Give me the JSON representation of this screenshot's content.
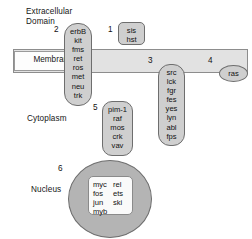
{
  "figure": {
    "type": "diagram",
    "regions": {
      "extracellular": "Extracellular\nDomain",
      "membrane": "Membrane",
      "cytoplasm": "Cytoplasm",
      "nucleus": "Nucleus"
    },
    "colors": {
      "background": "#ffffff",
      "membrane_fill": "#e2e2e2",
      "membrane_stroke": "#8d8d8d",
      "group_fill": "#cfcfcf",
      "group_stroke": "#6e6e6e",
      "nucleus_fill": "#b4b4b4",
      "nucleus_inner_fill": "#fafafa",
      "text": "#111111"
    }
  },
  "groups": [
    {
      "callout": "1",
      "name": "growth-factors",
      "location": "extracellular",
      "genes": [
        "sis",
        "hst"
      ]
    },
    {
      "callout": "2",
      "name": "receptor-tyrosine-kinases",
      "location": "membrane-spanning",
      "genes": [
        "erbB",
        "kit",
        "fms",
        "ret",
        "ros",
        "met",
        "neu",
        "trk"
      ]
    },
    {
      "callout": "3",
      "name": "membrane-associated-tyrosine-kinases",
      "location": "membrane-inner-face",
      "genes": [
        "src",
        "lck",
        "fgr",
        "fes",
        "yes",
        "lyn",
        "abl",
        "fps"
      ]
    },
    {
      "callout": "4",
      "name": "g-protein",
      "location": "membrane-inner-face",
      "genes": [
        "ras"
      ]
    },
    {
      "callout": "5",
      "name": "cytoplasmic-signaling",
      "location": "cytoplasm",
      "genes": [
        "pim-1",
        "raf",
        "mos",
        "crk",
        "vav"
      ]
    },
    {
      "callout": "6",
      "name": "nuclear-transcription-factors",
      "location": "nucleus",
      "genes_left": [
        "myc",
        "fos",
        "jun",
        "myb"
      ],
      "genes_right": [
        "rel",
        "ets",
        "ski"
      ]
    }
  ]
}
